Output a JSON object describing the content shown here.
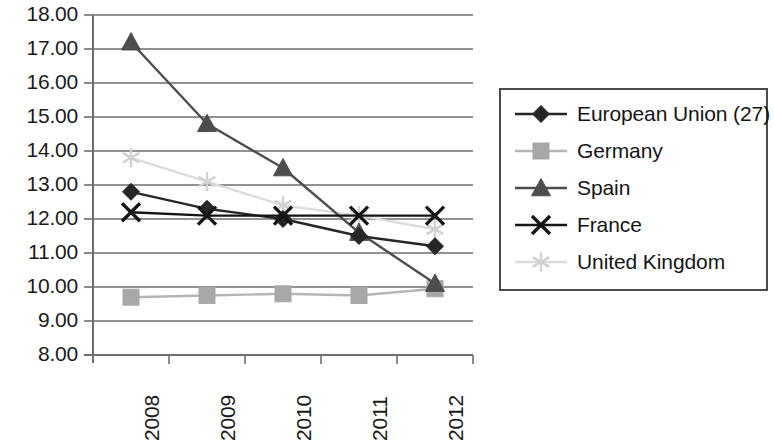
{
  "chart_data": {
    "type": "line",
    "title": "",
    "subtitle": "",
    "xlabel": "",
    "ylabel": "",
    "categories": [
      "2008",
      "2009",
      "2010",
      "2011",
      "2012"
    ],
    "x_tick_rotation": "-90",
    "ylim": [
      8.0,
      18.0
    ],
    "y_tick_step": 1.0,
    "y_tick_labels": [
      "18.00",
      "17.00",
      "16.00",
      "15.00",
      "14.00",
      "13.00",
      "12.00",
      "11.00",
      "10.00",
      "9.00",
      "8.00"
    ],
    "grid": "horizontal",
    "legend_position": "right",
    "series": [
      {
        "name": "European Union (27)",
        "marker": "diamond",
        "color": "#262626",
        "line_color": "#262626",
        "values": [
          12.8,
          12.3,
          12.0,
          11.5,
          11.2
        ]
      },
      {
        "name": "Germany",
        "marker": "square",
        "color": "#a8a8a8",
        "line_color": "#b5b5b5",
        "values": [
          9.7,
          9.75,
          9.8,
          9.75,
          9.95
        ]
      },
      {
        "name": "Spain",
        "marker": "triangle",
        "color": "#4d4d4d",
        "line_color": "#4d4d4d",
        "values": [
          17.2,
          14.8,
          13.5,
          11.6,
          10.1
        ]
      },
      {
        "name": "France",
        "marker": "cross",
        "color": "#151515",
        "line_color": "#151515",
        "values": [
          12.2,
          12.1,
          12.1,
          12.1,
          12.1
        ]
      },
      {
        "name": "United Kingdom",
        "marker": "asterisk",
        "color": "#d2d2d2",
        "line_color": "#dcdcdc",
        "values": [
          13.8,
          13.1,
          12.4,
          12.1,
          11.7
        ]
      }
    ]
  },
  "axis": {
    "axis_color": "#6e6e6e",
    "gridline_color": "#6e6e6e"
  },
  "legend": {
    "items": [
      {
        "label": "European Union (27)",
        "marker": "diamond-marker-icon"
      },
      {
        "label": "Germany",
        "marker": "square-marker-icon"
      },
      {
        "label": "Spain",
        "marker": "triangle-marker-icon"
      },
      {
        "label": "France",
        "marker": "cross-marker-icon"
      },
      {
        "label": "United Kingdom",
        "marker": "asterisk-marker-icon"
      }
    ]
  }
}
